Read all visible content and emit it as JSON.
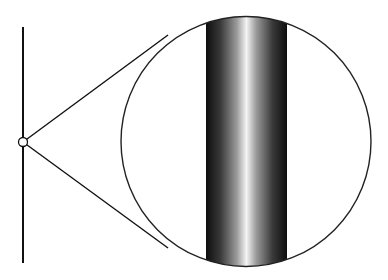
{
  "diagram": {
    "type": "magnification-inset",
    "canvas": {
      "width": 388,
      "height": 280,
      "background": "#ffffff"
    },
    "fiber_line": {
      "x": 23,
      "y1": 27,
      "y2": 263,
      "stroke": "#111111",
      "stroke_width": 2
    },
    "marker_circle": {
      "cx": 23,
      "cy": 142,
      "r": 4.5,
      "stroke": "#111111",
      "stroke_width": 1.3
    },
    "magnifier": {
      "cx": 246,
      "cy": 141.5,
      "r": 125,
      "stroke": "#222222",
      "stroke_width": 1.4,
      "tangent_top": {
        "x": 168,
        "y": 35
      },
      "tangent_bottom": {
        "x": 168,
        "y": 248
      }
    },
    "magnified_cylinder": {
      "x": 206,
      "width": 81,
      "gradient_stops": [
        {
          "offset": "0%",
          "color": "#0d0d0d"
        },
        {
          "offset": "18%",
          "color": "#3a3a3a"
        },
        {
          "offset": "38%",
          "color": "#9a9a9a"
        },
        {
          "offset": "50%",
          "color": "#f4f4f4"
        },
        {
          "offset": "62%",
          "color": "#9a9a9a"
        },
        {
          "offset": "82%",
          "color": "#3a3a3a"
        },
        {
          "offset": "100%",
          "color": "#0d0d0d"
        }
      ]
    }
  }
}
